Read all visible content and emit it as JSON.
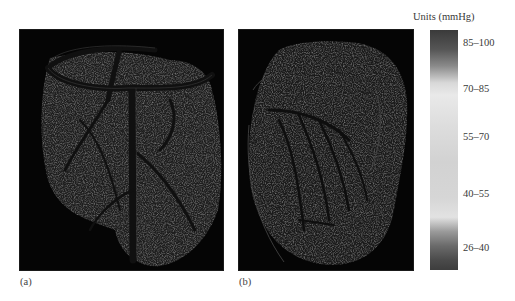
{
  "figure": {
    "panels": [
      {
        "id": "a",
        "label": "(a)",
        "subject": "tissue-pressure-map-a"
      },
      {
        "id": "b",
        "label": "(b)",
        "subject": "tissue-pressure-map-b"
      }
    ],
    "colorbar": {
      "title": "Units (mmHg)",
      "ranges": [
        "85–100",
        "70–85",
        "55–70",
        "40–55",
        "26–40"
      ],
      "colors": {
        "top": "#3a3a3a",
        "middle": "#dddddd",
        "bottom": "#3d3d3d"
      }
    },
    "background": "#ffffff",
    "panel_background": "#050505"
  }
}
